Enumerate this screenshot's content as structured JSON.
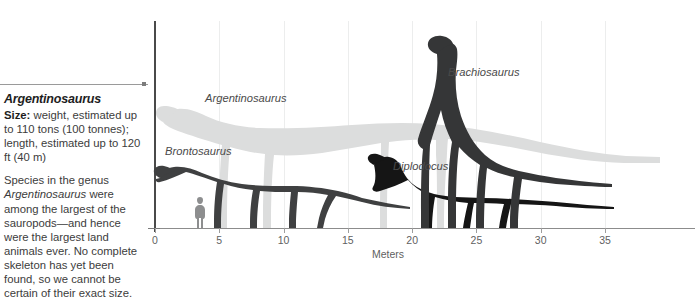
{
  "caption": {
    "title": "Argentinosaurus",
    "size_label": "Size:",
    "size_text": " weight, estimated up to 110 tons (100 tonnes); length, estimated up to 120 ft (40 m)",
    "body_pre": "Species in the genus ",
    "body_italic": "Argentinosaurus",
    "body_post": " were among the largest of the sauropods—and hence were the largest land animals ever. No complete skeleton has yet been found, so we cannot be certain of their exact size."
  },
  "chart_data": {
    "type": "bar",
    "title": "",
    "xlabel": "Meters",
    "ylabel": "",
    "xlim": [
      0,
      42
    ],
    "ylim": [
      0,
      16
    ],
    "grid": true,
    "legend": "inline-labels",
    "tick_labels": [
      "0",
      "5",
      "10",
      "15",
      "20",
      "25",
      "30",
      "35"
    ],
    "tick_values": [
      0,
      5,
      10,
      15,
      20,
      25,
      30,
      35
    ],
    "categories": [
      "Argentinosaurus",
      "Brachiosaurus",
      "Brontosaurus",
      "Diplodocus",
      "Human"
    ],
    "series": [
      {
        "name": "length_meters",
        "values": [
          40,
          24,
          22,
          27,
          1.8
        ]
      },
      {
        "name": "height_meters",
        "values": [
          9.5,
          13,
          5.5,
          4.5,
          1.8
        ]
      }
    ],
    "annotations": [
      {
        "text": "Argentinosaurus",
        "x": 4.0,
        "y": 8.2,
        "color": "#dedede"
      },
      {
        "text": "Brachiosaurus",
        "x": 23.0,
        "y": 12.3,
        "color": "#333333"
      },
      {
        "text": "Brontosaurus",
        "x": 0.9,
        "y": 6.4,
        "color": "#3a3a3a"
      },
      {
        "text": "Diplodocus",
        "x": 18.6,
        "y": 5.3,
        "color": "#1d1d1d"
      }
    ],
    "colors": {
      "argentinosaurus": "#dcdddd",
      "brontosaurus": "#3f4041",
      "diplodocus": "#151515",
      "brachiosaurus": "#353637",
      "human": "#8d8e8f",
      "axis": "#4a4a4a",
      "grid": "#eceded",
      "baseline": "#8c8c8c"
    }
  },
  "labels": {
    "argentinosaurus": "Argentinosaurus",
    "brachiosaurus": "Brachiosaurus",
    "brontosaurus": "Brontosaurus",
    "diplodocus": "Diplodocus"
  }
}
